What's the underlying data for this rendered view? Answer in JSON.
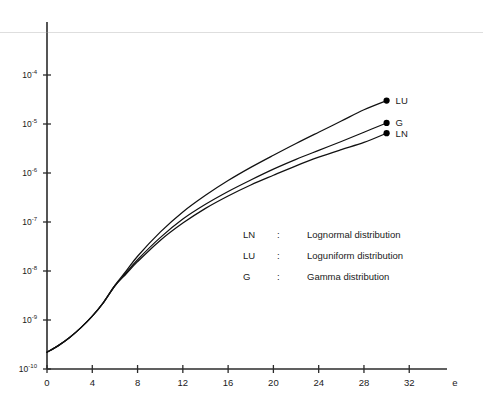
{
  "chart_data": {
    "type": "line",
    "title": "",
    "subtitle": "",
    "xlabel": "e",
    "ylabel": "",
    "yscale": "log",
    "xscale": "linear",
    "xlim": [
      0,
      34
    ],
    "ylim": [
      1e-10,
      0.0001
    ],
    "grid": false,
    "legend_position": "center-right-inside",
    "x_ticks": [
      0,
      4,
      8,
      12,
      16,
      20,
      24,
      28,
      32
    ],
    "x_tick_labels": [
      "0",
      "4",
      "8",
      "12",
      "16",
      "20",
      "24",
      "28",
      "32"
    ],
    "y_ticks": [
      0.0001,
      1e-05,
      1e-06,
      1e-07,
      1e-08,
      1e-09,
      1e-10
    ],
    "y_tick_labels": [
      {
        "mantissa": "10",
        "exponent": "-4"
      },
      {
        "mantissa": "10",
        "exponent": "-5"
      },
      {
        "mantissa": "10",
        "exponent": "-6"
      },
      {
        "mantissa": "10",
        "exponent": "-7"
      },
      {
        "mantissa": "10",
        "exponent": "-8"
      },
      {
        "mantissa": "10",
        "exponent": "-9"
      },
      {
        "mantissa": "10",
        "exponent": "-10"
      }
    ],
    "series": [
      {
        "name": "LN",
        "endpoint_label": "LN",
        "marker": "filled-circle",
        "x": [
          0,
          1,
          2,
          3,
          4,
          5,
          6,
          7,
          8,
          10,
          12,
          14,
          16,
          18,
          20,
          22,
          24,
          26,
          28,
          30
        ],
        "y": [
          2.2e-10,
          3e-10,
          4.4e-10,
          7e-10,
          1.2e-09,
          2.3e-09,
          5e-09,
          8.8e-09,
          1.55e-08,
          4.2e-08,
          9.5e-08,
          1.9e-07,
          3.4e-07,
          5.7e-07,
          9e-07,
          1.4e-06,
          2.1e-06,
          3e-06,
          4.2e-06,
          6.5e-06
        ]
      },
      {
        "name": "G",
        "endpoint_label": "G",
        "marker": "filled-circle",
        "x": [
          0,
          1,
          2,
          3,
          4,
          5,
          6,
          7,
          8,
          10,
          12,
          14,
          16,
          18,
          20,
          22,
          24,
          26,
          28,
          30
        ],
        "y": [
          2.2e-10,
          3e-10,
          4.4e-10,
          7e-10,
          1.2e-09,
          2.3e-09,
          5e-09,
          9.2e-09,
          1.7e-08,
          4.8e-08,
          1.15e-07,
          2.3e-07,
          4.2e-07,
          7.2e-07,
          1.2e-06,
          1.9e-06,
          2.9e-06,
          4.4e-06,
          6.8e-06,
          1.05e-05
        ]
      },
      {
        "name": "LU",
        "endpoint_label": "LU",
        "marker": "filled-circle",
        "x": [
          0,
          1,
          2,
          3,
          4,
          5,
          6,
          7,
          8,
          10,
          12,
          14,
          16,
          18,
          20,
          22,
          24,
          26,
          28,
          30
        ],
        "y": [
          2.2e-10,
          3e-10,
          4.4e-10,
          7e-10,
          1.2e-09,
          2.3e-09,
          5.1e-09,
          1e-08,
          2e-08,
          6.2e-08,
          1.6e-07,
          3.5e-07,
          7e-07,
          1.3e-06,
          2.3e-06,
          4e-06,
          6.8e-06,
          1.15e-05,
          1.95e-05,
          3e-05
        ]
      }
    ],
    "legend_entries": [
      {
        "key": "LN",
        "separator": ":",
        "description": "Lognormal distribution"
      },
      {
        "key": "LU",
        "separator": ":",
        "description": "Loguniform distribution"
      },
      {
        "key": "G",
        "separator": ":",
        "description": "Gamma distribution"
      }
    ]
  }
}
